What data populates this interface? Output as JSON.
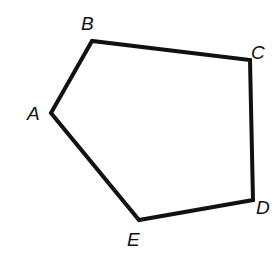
{
  "diagram": {
    "type": "polygon",
    "shape": "pentagon",
    "stroke_color": "#111111",
    "background": "#ffffff",
    "vertices": [
      {
        "name": "A",
        "x": 51,
        "y": 113,
        "label_x": 27,
        "label_y": 120
      },
      {
        "name": "B",
        "x": 92,
        "y": 41,
        "label_x": 81,
        "label_y": 30
      },
      {
        "name": "C",
        "x": 250,
        "y": 60,
        "label_x": 251,
        "label_y": 59
      },
      {
        "name": "D",
        "x": 253,
        "y": 200,
        "label_x": 256,
        "label_y": 214
      },
      {
        "name": "E",
        "x": 139,
        "y": 220,
        "label_x": 127,
        "label_y": 246
      }
    ],
    "edges": [
      [
        "A",
        "B"
      ],
      [
        "B",
        "C"
      ],
      [
        "C",
        "D"
      ],
      [
        "D",
        "E"
      ],
      [
        "E",
        "A"
      ]
    ],
    "labels": {
      "A": "A",
      "B": "B",
      "C": "C",
      "D": "D",
      "E": "E"
    }
  }
}
